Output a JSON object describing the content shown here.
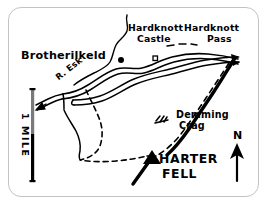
{
  "figure": {
    "kind": "hand-drawn-sketch-map",
    "region": "Harter Fell / Hardknott, Eskdale",
    "frame_color": "#c3c3c3",
    "ink_color": "#000000",
    "background_color": "#ffffff",
    "scale_bar_gray": "#7a7a7a"
  },
  "labels": {
    "brotherilkeld": "Brotherilkeld",
    "river_esk": "R. Esk",
    "hardknott_castle_line1": "Hardknott",
    "hardknott_castle_line2": "Castle",
    "hardknott_pass_line1": "Hardknott",
    "hardknott_pass_line2": "Pass",
    "demming_crag_line1": "Demming",
    "demming_crag_line2": "Crag",
    "harter_fell_line1": "HARTER",
    "harter_fell_line2": "FELL",
    "north": "N",
    "scale_mile": "1 MILE"
  },
  "map_features": [
    {
      "name": "river-esk",
      "type": "river",
      "style": "solid-double-line",
      "label": "R. Esk"
    },
    {
      "name": "hardknott-pass-road",
      "type": "road",
      "style": "solid-double-line",
      "label": "Hardknott Pass"
    },
    {
      "name": "footpath-loop",
      "type": "footpath",
      "style": "dashed",
      "label": ""
    },
    {
      "name": "footpath-demming",
      "type": "footpath",
      "style": "dashed",
      "label": ""
    },
    {
      "name": "demming-crag-ridge",
      "type": "ridge",
      "style": "thick-solid",
      "label": "Demming Crag"
    },
    {
      "name": "harter-fell-summit",
      "type": "summit-marker",
      "style": "filled-triangle",
      "label": "HARTER FELL"
    },
    {
      "name": "hardknott-castle-marker",
      "type": "site-marker",
      "style": "small-square",
      "label": "Hardknott Castle"
    },
    {
      "name": "brotherilkeld-marker",
      "type": "site-marker",
      "style": "filled-dot",
      "label": "Brotherilkeld"
    },
    {
      "name": "crag-hatching",
      "type": "crag-symbol",
      "style": "hatch-ticks",
      "label": ""
    },
    {
      "name": "flow-arrow",
      "type": "direction-arrow",
      "style": "arrowhead",
      "label": ""
    }
  ],
  "scale_bar": {
    "length_label": "1 MILE",
    "orientation": "vertical",
    "upper_half_color": "#7a7a7a",
    "lower_half_color": "#000000"
  },
  "north_arrow": {
    "label": "N",
    "direction": "up"
  }
}
